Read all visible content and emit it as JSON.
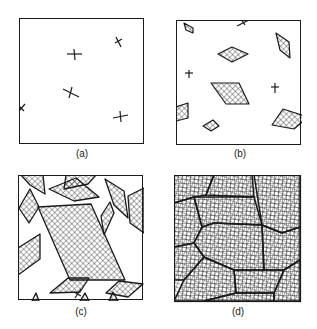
{
  "figure": {
    "panels": [
      {
        "id": "a",
        "label": "(a)",
        "description": "Nuclei appear as small crosses in the melt"
      },
      {
        "id": "b",
        "label": "(b)",
        "description": "Small cross-hatched crystals growing, some nuclei remain"
      },
      {
        "id": "c",
        "label": "(c)",
        "description": "Larger crystals occupying most of the area"
      },
      {
        "id": "d",
        "label": "(d)",
        "description": "Crystals impinge to fill the area forming grains"
      }
    ],
    "colors": {
      "line": "#1a1a1a",
      "background": "#ffffff"
    }
  }
}
